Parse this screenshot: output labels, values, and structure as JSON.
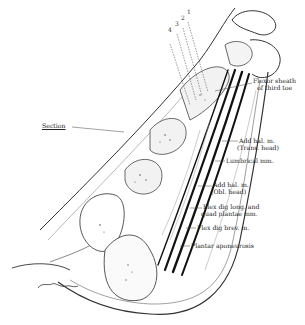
{
  "figure": {
    "colors": {
      "ink": "#222222",
      "background": "#ffffff",
      "tendon": "#111111",
      "shade": "#cfcfcf"
    },
    "section_numbers": [
      "4",
      "3",
      "2",
      "1"
    ],
    "labels": {
      "section": "Section",
      "flexor_sheath_1": "Flexor sheath",
      "flexor_sheath_2": "of third toe",
      "add_hal_trans_1": "Add hal. m.",
      "add_hal_trans_2": "(Trans. head)",
      "lumbrical": "Lumbrical mm.",
      "add_hal_obl_1": "Add hal. m.",
      "add_hal_obl_2": "(Obl. head)",
      "flex_dig_long_1": "Flex dig long. and",
      "flex_dig_long_2": "quad plantae mm.",
      "flex_dig_brev": "Flex dig brev. m.",
      "plantar_aponeurosis": "Plantar aponeurosis"
    }
  }
}
